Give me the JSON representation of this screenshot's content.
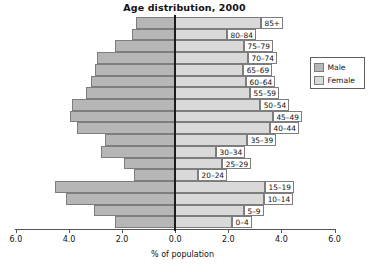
{
  "chart_data": {
    "type": "bar",
    "subtype": "population-pyramid",
    "title": "Age distribution, 2000",
    "xlabel": "% of population",
    "ylabel": "",
    "categories": [
      "0–4",
      "5–9",
      "10–14",
      "15–19",
      "20–24",
      "25–29",
      "30–34",
      "35–39",
      "40–44",
      "45–49",
      "50–54",
      "55–59",
      "60–64",
      "65–69",
      "70–74",
      "75–79",
      "80–84",
      "85+"
    ],
    "series": [
      {
        "name": "Male",
        "color": "#b6b6b6",
        "side": "left",
        "values": [
          2.26,
          3.05,
          4.1,
          4.51,
          1.54,
          1.92,
          2.78,
          2.63,
          3.68,
          3.95,
          3.87,
          3.35,
          3.16,
          3.01,
          2.93,
          2.26,
          1.62,
          1.47
        ]
      },
      {
        "name": "Female",
        "color": "#d9d9d9",
        "side": "right",
        "values": [
          2.14,
          2.59,
          3.35,
          3.38,
          0.86,
          1.77,
          1.54,
          2.71,
          3.57,
          3.68,
          3.2,
          2.82,
          2.67,
          2.56,
          2.74,
          2.59,
          1.95,
          3.23
        ]
      }
    ],
    "xticks": [
      6.0,
      4.0,
      2.0,
      0.0,
      2.0,
      4.0,
      6.0
    ],
    "xtick_labels": [
      "6.0",
      "4.0",
      "2.0",
      "0.0",
      "2.0",
      "4.0",
      "6.0"
    ],
    "xlim": [
      -6.0,
      6.0
    ],
    "grid": false,
    "legend": {
      "position": "top-right",
      "entries": [
        {
          "label": "Male",
          "color": "#b6b6b6"
        },
        {
          "label": "Female",
          "color": "#d9d9d9"
        }
      ]
    },
    "colors": {
      "male": "#b6b6b6",
      "female": "#d9d9d9",
      "bar_border": "#7d7d7d",
      "axis": "#555555",
      "center_line": "#1b1b1b",
      "background": "#ffffff",
      "text": "#111111"
    }
  }
}
